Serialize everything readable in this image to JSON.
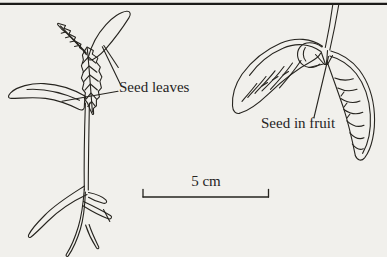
{
  "figure": {
    "type": "line-drawing",
    "labels": {
      "seed_leaves": "Seed leaves",
      "seed_in_fruit": "Seed in fruit",
      "scale_bar": "5 cm"
    },
    "colors": {
      "ink": "#26241f",
      "paper": "#f1f0ec",
      "rule": "#1c1b19"
    },
    "elements": [
      "seedling-drawing",
      "winged-seed-drawing",
      "scale-bar",
      "top-rule"
    ]
  }
}
